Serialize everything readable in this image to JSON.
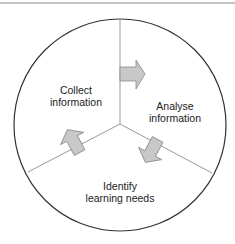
{
  "diagram": {
    "type": "cycle",
    "segments": [
      {
        "id": "collect",
        "line1": "Collect",
        "line2": "information"
      },
      {
        "id": "analyse",
        "line1": "Analyse",
        "line2": "information"
      },
      {
        "id": "identify",
        "line1": "Identify",
        "line2": "learning needs"
      }
    ],
    "arrows": [
      {
        "from": "collect",
        "to": "analyse",
        "direction": "right"
      },
      {
        "from": "analyse",
        "to": "identify",
        "direction": "down-left"
      },
      {
        "from": "identify",
        "to": "collect",
        "direction": "up-left"
      }
    ],
    "colors": {
      "outline": "#333333",
      "divider": "#999999",
      "arrow_fill": "#c8c8c8",
      "arrow_stroke": "#888888"
    }
  }
}
